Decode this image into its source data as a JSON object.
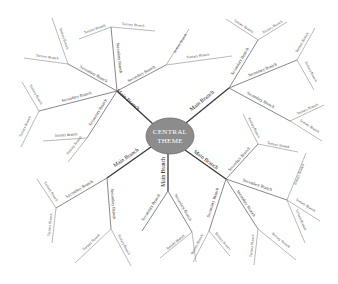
{
  "center": {
    "line1": "CENTRAL",
    "line2": "THEME",
    "fill": "#8c8c8c",
    "stroke": "#6e6e6e"
  },
  "labels": {
    "main": "Main Branch",
    "secondary": "Secondary Branch",
    "tertiary": "Tertiary Branch"
  },
  "colors": {
    "background": "#ffffff",
    "main_line": "#3a3a3a",
    "secondary_line": "#6a6a6a",
    "tertiary_line": "#8a8a8a"
  },
  "branch_counts": {
    "main": 5,
    "secondary": 15,
    "tertiary": 30
  }
}
